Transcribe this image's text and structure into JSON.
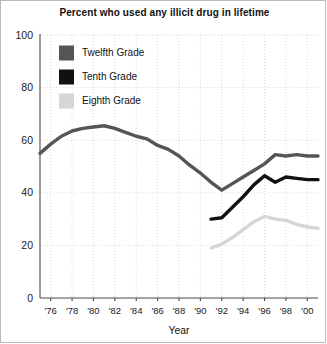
{
  "chart_data": {
    "type": "line",
    "title": "Percent who used any illicit drug in lifetime",
    "xlabel": "Year",
    "ylabel": "",
    "xlim": [
      1975,
      2001
    ],
    "ylim": [
      0,
      100
    ],
    "grid": true,
    "legend_position": "top-left",
    "y_ticks": [
      "0",
      "20",
      "40",
      "60",
      "80",
      "100"
    ],
    "y_tick_values": [
      0,
      20,
      40,
      60,
      80,
      100
    ],
    "x_ticks": [
      "'76",
      "'78",
      "'80",
      "'82",
      "'84",
      "'86",
      "'88",
      "'90",
      "'92",
      "'94",
      "'96",
      "'98",
      "'00"
    ],
    "x_tick_values": [
      1976,
      1978,
      1980,
      1982,
      1984,
      1986,
      1988,
      1990,
      1992,
      1994,
      1996,
      1998,
      2000
    ],
    "series": [
      {
        "name": "Twelfth Grade",
        "color": "#555555",
        "x": [
          1975,
          1976,
          1977,
          1978,
          1979,
          1980,
          1981,
          1982,
          1983,
          1984,
          1985,
          1986,
          1987,
          1988,
          1989,
          1990,
          1991,
          1992,
          1993,
          1994,
          1995,
          1996,
          1997,
          1998,
          1999,
          2000,
          2001
        ],
        "values": [
          55.0,
          58.5,
          61.5,
          63.5,
          64.5,
          65.0,
          65.5,
          64.5,
          63.0,
          61.5,
          60.5,
          58.0,
          56.5,
          54.0,
          50.5,
          47.5,
          44.0,
          41.0,
          43.5,
          46.0,
          48.5,
          51.0,
          54.5,
          54.0,
          54.5,
          54.0,
          54.0
        ]
      },
      {
        "name": "Tenth Grade",
        "color": "#111111",
        "x": [
          1991,
          1992,
          1993,
          1994,
          1995,
          1996,
          1997,
          1998,
          1999,
          2000,
          2001
        ],
        "values": [
          30.0,
          30.5,
          34.5,
          38.5,
          43.0,
          46.5,
          44.0,
          46.0,
          45.5,
          45.0,
          45.0
        ]
      },
      {
        "name": "Eighth Grade",
        "color": "#d6d6d6",
        "x": [
          1991,
          1992,
          1993,
          1994,
          1995,
          1996,
          1997,
          1998,
          1999,
          2000,
          2001
        ],
        "values": [
          19.0,
          20.5,
          23.0,
          26.0,
          29.0,
          31.0,
          30.0,
          29.5,
          28.0,
          27.0,
          26.5
        ]
      }
    ]
  },
  "legend": {
    "items": [
      {
        "label": "Twelfth Grade",
        "color": "#555555"
      },
      {
        "label": "Tenth Grade",
        "color": "#111111"
      },
      {
        "label": "Eighth Grade",
        "color": "#d6d6d6"
      }
    ]
  }
}
